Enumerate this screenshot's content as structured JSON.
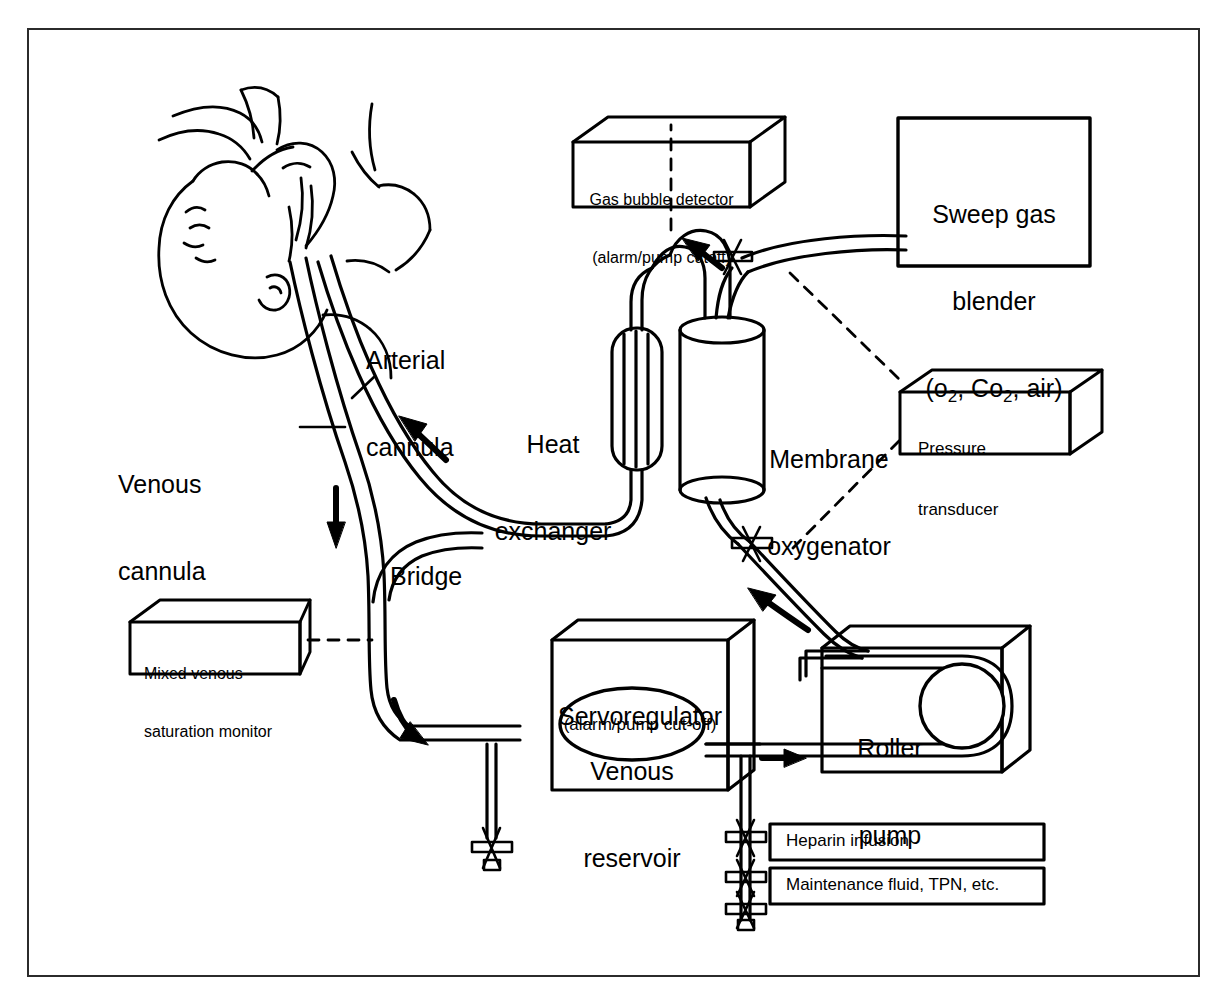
{
  "figure": {
    "type": "diagram",
    "frame": {
      "border_color": "#2b2b2b",
      "background": "#ffffff"
    }
  },
  "devices": {
    "gas_bubble_detector": {
      "line1": "Gas bubble detector",
      "line2": "(alarm/pump cutoff)",
      "shape": "3d-box"
    },
    "sweep_gas_blender": {
      "line1": "Sweep gas",
      "line2": "blender",
      "line3_prefix": "(o",
      "line3_sub1": "2",
      "line3_mid": ", Co",
      "line3_sub2": "2",
      "line3_suffix": ", air)",
      "line3_plain": "(o2, Co2, air)",
      "shape": "flat-box"
    },
    "pressure_transducer": {
      "line1": "Pressure",
      "line2": "transducer",
      "shape": "3d-box"
    },
    "mixed_venous_saturation_monitor": {
      "line1": "Mixed venous",
      "line2": "saturation monitor",
      "shape": "3d-box"
    },
    "servoregulator": {
      "line1": "Servoregulator",
      "line2": "(alarm/pump cut-off)",
      "shape": "3d-box"
    },
    "venous_reservoir": {
      "line1": "Venous",
      "line2": "reservoir",
      "shape": "ellipse"
    },
    "roller_pump": {
      "line1": "Roller",
      "line2": "pump",
      "shape": "3d-box-with-rotor"
    },
    "heparin_infusion": {
      "label": "Heparin infusion",
      "shape": "rect"
    },
    "maintenance_fluid": {
      "label": "Maintenance fluid, TPN, etc.",
      "shape": "rect"
    }
  },
  "components": {
    "heat_exchanger": {
      "line1": "Heat",
      "line2": "exchanger"
    },
    "membrane_oxygenator": {
      "line1": "Membrane",
      "line2": "oxygenator"
    },
    "bridge": {
      "label": "Bridge"
    },
    "arterial_cannula": {
      "line1": "Arterial",
      "line2": "cannula"
    },
    "venous_cannula": {
      "line1": "Venous",
      "line2": "cannula"
    },
    "patient": {
      "description": "infant head and torso, line drawing"
    }
  },
  "flow_arrows": [
    {
      "name": "venous-drainage-down",
      "direction": "down"
    },
    {
      "name": "venous-to-reservoir",
      "direction": "down-right"
    },
    {
      "name": "reservoir-to-pump",
      "direction": "right"
    },
    {
      "name": "pump-to-oxygenator",
      "direction": "up-left"
    },
    {
      "name": "oxygenator-outlet-up",
      "direction": "up-left"
    },
    {
      "name": "arterial-return-to-patient",
      "direction": "up-left"
    }
  ],
  "connectors": {
    "dashed_lines": [
      "gas-bubble-detector-to-arterial-line",
      "sweep-gas-blender-to-oxygenator-inlet",
      "pressure-transducer-to-preoxygenator-stopcock",
      "pressure-transducer-to-postoxygenator-stopcock",
      "mixed-venous-monitor-to-venous-line"
    ],
    "stopcocks": 6
  }
}
